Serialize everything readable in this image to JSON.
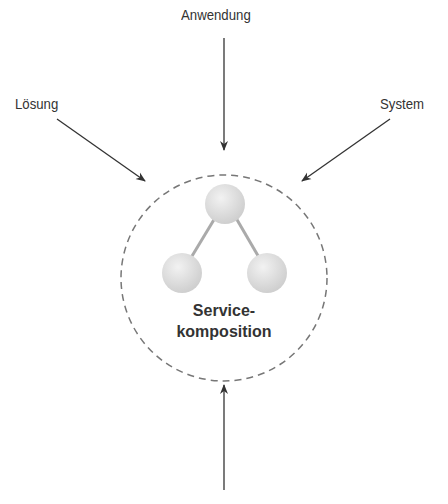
{
  "diagram": {
    "labels": {
      "top": "Anwendung",
      "left": "Lösung",
      "right": "System",
      "bottom": ""
    },
    "center": {
      "line1": "Service-",
      "line2": "komposition"
    },
    "colors": {
      "arrow": "#333333",
      "circle_dash": "#777777",
      "node_fill": "#dddddd",
      "link": "#aaaaaa",
      "text": "#333333"
    }
  }
}
